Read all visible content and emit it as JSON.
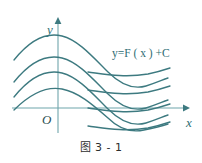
{
  "figure": {
    "caption": "图 3 - 1",
    "annotation": "y=F ( x ) +C",
    "axis_x_label": "x",
    "axis_y_label": "y",
    "origin_label": "O",
    "curve_color": "#3d7a80",
    "axis_color": "#6fa5ab",
    "background_color": "#ffffff"
  },
  "chart_data": {
    "type": "line",
    "title": "图 3 - 1",
    "subtitle": "",
    "xlabel": "x",
    "ylabel": "y",
    "annotations": [
      {
        "text": "y=F ( x ) +C",
        "x": 112,
        "y": 53
      }
    ],
    "axis_origin": {
      "x": 58,
      "y": 108
    },
    "axis_x_range_px": [
      12,
      185
    ],
    "axis_y_range_px": [
      17,
      133
    ],
    "grid": false,
    "legend": false,
    "vertical_offsets": [
      0,
      22,
      44,
      66
    ],
    "series": [
      {
        "name": "y=F(x)+C1",
        "path": "M 14,60 C 30,40 46,32 62,36 C 78,40 92,56 108,72 C 120,84 132,90 146,86 C 156,83 162,80 168,78"
      },
      {
        "name": "y=F(x)+C2",
        "path": "M 14,82 C 30,62 46,54 62,58 C 78,62 92,78 108,94 C 120,106 132,112 146,108 C 156,105 162,102 168,100"
      },
      {
        "name": "y=F(x)+C3",
        "path": "M 14,97 C 30,77 46,69 62,73 C 78,77 92,93 108,109 C 120,121 132,127 146,123 C 156,120 162,117 168,115"
      },
      {
        "name": "y=F(x)+C4",
        "path": "M 14,110 C 30,94 46,86 62,89 C 78,92 92,104 108,118 C 118,128 130,133 144,130 C 154,128 162,126 168,124"
      }
    ],
    "tail_segments": [
      {
        "name": "tail-1",
        "path": "M 88,72 C 104,74 124,78 148,74 C 158,72 164,70 170,68"
      },
      {
        "name": "tail-2",
        "path": "M 88,90 C 104,92 124,96 148,92 C 158,90 164,88 170,86"
      },
      {
        "name": "tail-3",
        "path": "M 88,108 C 104,110 124,114 148,110 C 158,108 164,106 170,104"
      },
      {
        "name": "tail-4",
        "path": "M 88,126 C 104,128 124,132 148,128 C 158,126 164,124 170,122"
      }
    ]
  }
}
